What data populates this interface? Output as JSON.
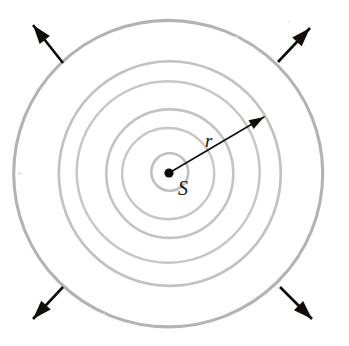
{
  "figure": {
    "background_color": "#ffffff",
    "width": 349,
    "height": 346,
    "source": {
      "label": "S",
      "center_x": 169,
      "center_y": 173,
      "dot_radius": 4.6,
      "dot_color": "#0d0b09",
      "label_x": 178,
      "label_y": 195
    },
    "radius_vector": {
      "label": "r",
      "from_x": 169,
      "from_y": 173,
      "to_x": 264,
      "to_y": 117,
      "label_x": 205,
      "label_y": 147,
      "color": "#15120f"
    },
    "wavefronts": [
      {
        "name": "wavefront-1",
        "radius": 18.5,
        "stroke": "#c2c0be",
        "stroke_width": 2.6
      },
      {
        "name": "wavefront-2",
        "radius": 46.0,
        "stroke": "#c9c7c5",
        "stroke_width": 2.4
      },
      {
        "name": "wavefront-3",
        "radius": 63.5,
        "stroke": "#c5c3c1",
        "stroke_width": 2.6
      },
      {
        "name": "wavefront-4",
        "radius": 91.5,
        "stroke": "#c9c7c5",
        "stroke_width": 2.5
      },
      {
        "name": "wavefront-5",
        "radius": 111.0,
        "stroke": "#c4c2c0",
        "stroke_width": 2.7
      },
      {
        "name": "wavefront-6",
        "radius": 154.5,
        "stroke": "#b5b3b1",
        "stroke_width": 3.1
      }
    ],
    "propagation_arrows": [
      {
        "name": "propagation-arrow-top-left",
        "x1": 63,
        "y1": 63,
        "x2": 33,
        "y2": 25
      },
      {
        "name": "propagation-arrow-top-right",
        "x1": 278,
        "y1": 62,
        "x2": 310,
        "y2": 28
      },
      {
        "name": "propagation-arrow-bottom-left",
        "x1": 63,
        "y1": 287,
        "x2": 33,
        "y2": 319
      },
      {
        "name": "propagation-arrow-bottom-right",
        "x1": 280,
        "y1": 287,
        "x2": 312,
        "y2": 319
      }
    ],
    "specks": [
      {
        "x": 235,
        "y": 36,
        "size": 3
      },
      {
        "x": 18,
        "y": 172,
        "size": 3
      },
      {
        "x": 288,
        "y": 21,
        "size": 2
      },
      {
        "x": 103,
        "y": 313,
        "size": 2
      }
    ]
  }
}
